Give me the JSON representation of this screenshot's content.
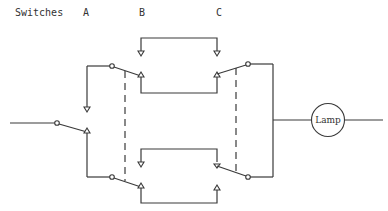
{
  "header": {
    "title_label": "Switches",
    "switch_labels": [
      "A",
      "B",
      "C"
    ]
  },
  "diagram": {
    "type": "two-way / intermediate switch circuit",
    "components": [
      {
        "id": "switch-a",
        "kind": "two-way switch"
      },
      {
        "id": "switch-b",
        "kind": "intermediate switch (two ganged blades, dashed link)"
      },
      {
        "id": "switch-c",
        "kind": "intermediate switch (two ganged blades, dashed link)"
      },
      {
        "id": "lamp",
        "kind": "lamp"
      }
    ],
    "lamp_label": "Lamp",
    "line_color": "#3a3a3a"
  }
}
